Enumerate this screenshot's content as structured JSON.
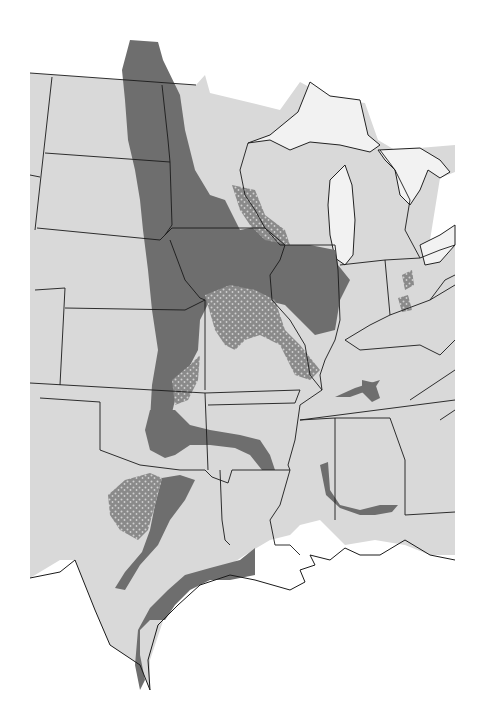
{
  "map": {
    "description": "Grayscale map of the central United States showing a shaded distribution region",
    "colors": {
      "background": "#ffffff",
      "land": "#d9d9d9",
      "lakes": "#f2f2f2",
      "region_dense": "#6e6e6e",
      "region_sparse": "#9a9a9a",
      "borders": "#1a1a1a"
    },
    "legend": null,
    "labels": []
  }
}
